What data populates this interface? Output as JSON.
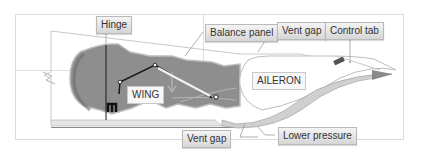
{
  "diagram": {
    "type": "aileron balance panel cross-section",
    "labels": {
      "hinge": "Hinge",
      "balance_panel": "Balance panel",
      "vent_gap_top": "Vent gap",
      "control_tab": "Control tab",
      "wing": "WING",
      "aileron": "AILERON",
      "vent_gap_bottom": "Vent gap",
      "lower_pressure": "Lower pressure"
    },
    "colors": {
      "wing_fill": "#8c8c8c",
      "wing_dark": "#6f6f6f",
      "outline": "#c9c9c9",
      "frame": "#dedede",
      "linkage": "#1a1a1a",
      "airflow": "#a0a0a0",
      "arrow": "#7a7a7a"
    }
  }
}
